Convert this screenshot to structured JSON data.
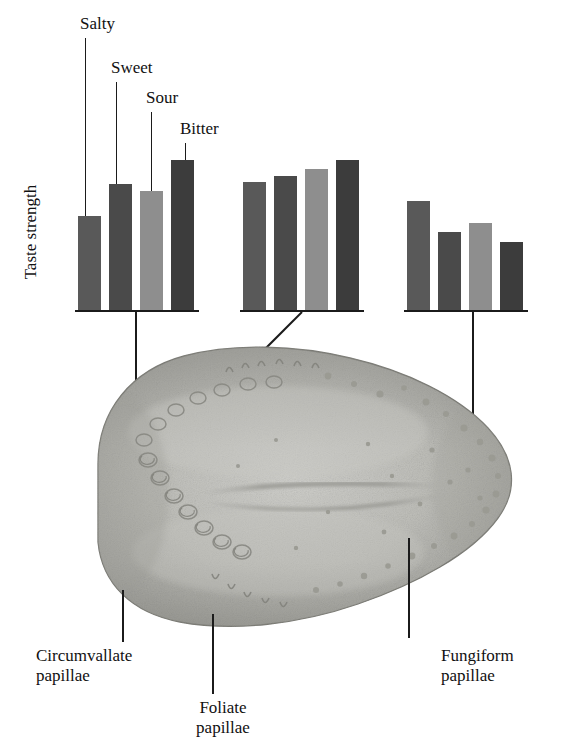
{
  "figure": {
    "axis_title": "Taste strength",
    "illustration_name": "human-tongue-dorsum"
  },
  "legend": {
    "items": [
      {
        "label": "Salty",
        "color": "#595959"
      },
      {
        "label": "Sweet",
        "color": "#4a4a4a"
      },
      {
        "label": "Sour",
        "color": "#8e8e8e"
      },
      {
        "label": "Bitter",
        "color": "#3c3c3c"
      }
    ]
  },
  "annotations": [
    {
      "id": "circumvallate",
      "line1": "Circumvallate",
      "line2": "papillae"
    },
    {
      "id": "foliate",
      "line1": "Foliate",
      "line2": "papillae"
    },
    {
      "id": "fungiform",
      "line1": "Fungiform",
      "line2": "papillae"
    }
  ],
  "chart_data": {
    "type": "bar",
    "title": "Taste strength",
    "xlabel": "",
    "ylabel": "Taste strength",
    "ylim": [
      0,
      100
    ],
    "grid": false,
    "legend_position": "top-left-leader-lines",
    "categories": [
      "Salty",
      "Sweet",
      "Sour",
      "Bitter"
    ],
    "colors": [
      "#595959",
      "#4a4a4a",
      "#8e8e8e",
      "#3c3c3c"
    ],
    "groups": [
      {
        "name": "Circumvallate papillae",
        "region": "circumvallate",
        "values": [
          62,
          83,
          78,
          99
        ]
      },
      {
        "name": "Foliate papillae",
        "region": "foliate",
        "values": [
          84,
          88,
          93,
          99
        ]
      },
      {
        "name": "Fungiform papillae",
        "region": "fungiform",
        "values": [
          72,
          51,
          57,
          45
        ]
      }
    ]
  }
}
